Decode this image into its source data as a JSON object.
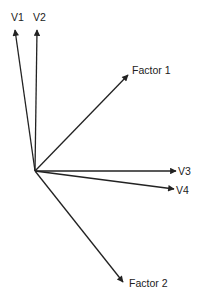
{
  "diagram": {
    "origin": [
      35,
      171
    ],
    "line_color": "#222222",
    "vectors": [
      {
        "id": "v1",
        "label": "V1",
        "tip": [
          15,
          30
        ],
        "label_pos": [
          11,
          21
        ]
      },
      {
        "id": "v2",
        "label": "V2",
        "tip": [
          37,
          30
        ],
        "label_pos": [
          33,
          21
        ]
      },
      {
        "id": "factor1",
        "label": "Factor 1",
        "tip": [
          128,
          75
        ],
        "label_pos": [
          132,
          74
        ]
      },
      {
        "id": "v3",
        "label": "V3",
        "tip": [
          176,
          171
        ],
        "label_pos": [
          178,
          175
        ]
      },
      {
        "id": "v4",
        "label": "V4",
        "tip": [
          174,
          189
        ],
        "label_pos": [
          176,
          194
        ]
      },
      {
        "id": "factor2",
        "label": "Factor 2",
        "tip": [
          123,
          282
        ],
        "label_pos": [
          129,
          287
        ]
      }
    ]
  }
}
